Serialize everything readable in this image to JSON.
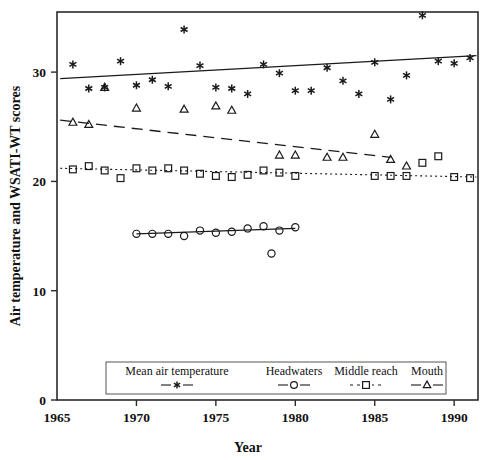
{
  "chart_data": {
    "type": "scatter",
    "title": "",
    "xlabel": "Year",
    "ylabel": "Air temperature and WSATI-WT scores",
    "xlim": [
      1965,
      1991.5
    ],
    "ylim": [
      0,
      35.5
    ],
    "xticks": [
      1965,
      1970,
      1975,
      1980,
      1985,
      1990
    ],
    "xticklabels": [
      "1965",
      "1970",
      "1975",
      "1980",
      "1985",
      "1990"
    ],
    "yticks": [
      0,
      10,
      20,
      30
    ],
    "yticklabels": [
      "0",
      "10",
      "20",
      "30"
    ],
    "grid": false,
    "legend_position": "bottom-center",
    "series": [
      {
        "name": "Mean air temperature",
        "marker": "asterisk",
        "line": "solid-trend",
        "x": [
          1966,
          1967,
          1968,
          1969,
          1970,
          1971,
          1972,
          1973,
          1974,
          1975,
          1976,
          1977,
          1978,
          1979,
          1980,
          1981,
          1982,
          1983,
          1984,
          1985,
          1986,
          1987,
          1988,
          1989,
          1990,
          1991
        ],
        "y": [
          30.7,
          28.5,
          28.6,
          31.0,
          28.8,
          29.3,
          28.7,
          33.9,
          30.6,
          28.6,
          28.5,
          28.0,
          30.7,
          29.9,
          28.3,
          28.3,
          30.4,
          29.2,
          28.0,
          30.9,
          27.5,
          29.7,
          35.2,
          31.0,
          30.8,
          31.3
        ],
        "trend": {
          "x0": 1965.2,
          "y0": 29.4,
          "x1": 1991.4,
          "y1": 31.5
        }
      },
      {
        "name": "Headwaters",
        "marker": "circle",
        "line": "solid-connected",
        "x": [
          1970,
          1971,
          1972,
          1973,
          1974,
          1975,
          1976,
          1977,
          1978,
          1978.5,
          1979,
          1980
        ],
        "y": [
          15.2,
          15.2,
          15.2,
          15.0,
          15.5,
          15.3,
          15.4,
          15.7,
          15.9,
          13.4,
          15.5,
          15.8
        ],
        "trend": {
          "x0": 1970,
          "y0": 15.2,
          "x1": 1980,
          "y1": 15.7
        }
      },
      {
        "name": "Middle reach",
        "marker": "square",
        "line": "dotted-trend",
        "x": [
          1966,
          1967,
          1968,
          1969,
          1970,
          1971,
          1972,
          1973,
          1974,
          1975,
          1976,
          1977,
          1978,
          1979,
          1980,
          1985,
          1986,
          1987,
          1988,
          1989,
          1990,
          1991
        ],
        "y": [
          21.1,
          21.4,
          21.0,
          20.3,
          21.2,
          21.0,
          21.2,
          21.0,
          20.7,
          20.5,
          20.4,
          20.6,
          21.0,
          20.8,
          20.5,
          20.5,
          20.5,
          20.5,
          21.7,
          22.3,
          20.4,
          20.3
        ],
        "trend": {
          "x0": 1965.2,
          "y0": 21.2,
          "x1": 1991.4,
          "y1": 20.4
        }
      },
      {
        "name": "Mouth",
        "marker": "triangle",
        "line": "dashed-trend",
        "x": [
          1966,
          1967,
          1968,
          1970,
          1973,
          1975,
          1976,
          1979,
          1980,
          1982,
          1983,
          1985,
          1986,
          1987
        ],
        "y": [
          25.4,
          25.2,
          28.6,
          26.7,
          26.6,
          26.9,
          26.5,
          22.4,
          22.4,
          22.2,
          22.2,
          24.3,
          22.0,
          21.4
        ],
        "trend": {
          "x0": 1965.2,
          "y0": 25.6,
          "x1": 1986.0,
          "y1": 22.2
        }
      }
    ],
    "legend": [
      {
        "label": "Mean air temperature",
        "marker": "asterisk",
        "line": "solid"
      },
      {
        "label": "Headwaters",
        "marker": "circle",
        "line": "solid"
      },
      {
        "label": "Middle reach",
        "marker": "square",
        "line": "dotted"
      },
      {
        "label": "Mouth",
        "marker": "triangle",
        "line": "solid"
      }
    ],
    "colors": {
      "ink": "#1a1a1a",
      "background": "#ffffff"
    }
  }
}
